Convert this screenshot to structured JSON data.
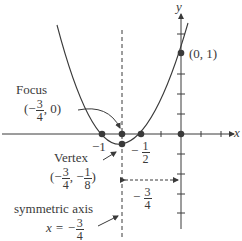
{
  "diagram": {
    "type": "parabola-graph",
    "function": "y = 2x^2 + 3x + 1",
    "axes": {
      "x_label": "x",
      "y_label": "y"
    },
    "points": {
      "y_intercept": {
        "label": "(0, 1)",
        "x": 0,
        "y": 1
      },
      "root_left": {
        "label": "−1",
        "x": -1,
        "y": 0
      },
      "root_right": {
        "label_sign": "−",
        "label_num": "1",
        "label_den": "2",
        "x": -0.5,
        "y": 0
      },
      "focus": {
        "title": "Focus",
        "x_sign": "(−",
        "x_num": "3",
        "x_den": "4",
        "y_rest": ", 0)",
        "x": -0.75,
        "y": 0
      },
      "vertex": {
        "title": "Vertex",
        "open": "(−",
        "x_num": "3",
        "x_den": "4",
        "mid": ", −",
        "y_num": "1",
        "y_den": "8",
        "close": ")",
        "x": -0.75,
        "y": -0.125
      },
      "origin": {
        "x": 0,
        "y": 0
      }
    },
    "axis_of_symmetry": {
      "title": "symmetric axis",
      "eq_lhs": "x = −",
      "num": "3",
      "den": "4",
      "x": -0.75
    },
    "distance_marker": {
      "sign": "−",
      "num": "3",
      "den": "4"
    },
    "colors": {
      "ink": "#3a3a3a",
      "background": "#ffffff"
    }
  }
}
